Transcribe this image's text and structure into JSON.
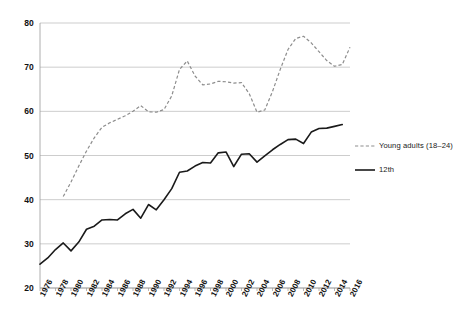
{
  "chart_data": {
    "type": "line",
    "title": "",
    "xlabel": "",
    "ylabel": "",
    "xlim": [
      1976,
      2016
    ],
    "ylim": [
      20,
      80
    ],
    "yticks": [
      20,
      30,
      40,
      50,
      60,
      70,
      80
    ],
    "xticks": [
      1976,
      1978,
      1980,
      1982,
      1984,
      1986,
      1988,
      1990,
      1992,
      1994,
      1996,
      1998,
      2000,
      2002,
      2004,
      2006,
      2008,
      2010,
      2012,
      2014,
      2016
    ],
    "grid": "horizontal",
    "legend_position": "right",
    "series": [
      {
        "name": "Young adults (18–24)",
        "style": "dashed",
        "color": "#8d8d8d",
        "x": [
          1979,
          1980,
          1981,
          1982,
          1983,
          1984,
          1985,
          1986,
          1987,
          1988,
          1989,
          1990,
          1991,
          1992,
          1993,
          1994,
          1995,
          1996,
          1997,
          1998,
          1999,
          2000,
          2001,
          2002,
          2003,
          2004,
          2005,
          2006,
          2007,
          2008,
          2009,
          2010,
          2011,
          2012,
          2013,
          2014,
          2015,
          2016
        ],
        "values": [
          40.7,
          44.0,
          47.6,
          51.0,
          54.0,
          56.4,
          57.4,
          58.2,
          59.0,
          60.0,
          61.3,
          59.9,
          59.8,
          60.4,
          63.5,
          69.5,
          71.4,
          68.0,
          66.0,
          66.2,
          66.8,
          66.7,
          66.4,
          66.5,
          64.0,
          59.8,
          60.3,
          64.5,
          69.5,
          74.0,
          76.5,
          77.0,
          75.5,
          73.5,
          71.5,
          70.2,
          70.6,
          74.5
        ]
      },
      {
        "name": "12th",
        "style": "solid",
        "color": "#1a1a1a",
        "x": [
          1976,
          1977,
          1978,
          1979,
          1980,
          1981,
          1982,
          1983,
          1984,
          1985,
          1986,
          1987,
          1988,
          1989,
          1990,
          1991,
          1992,
          1993,
          1994,
          1995,
          1996,
          1997,
          1998,
          1999,
          2000,
          2001,
          2002,
          2003,
          2004,
          2005,
          2006,
          2007,
          2008,
          2009,
          2010,
          2011,
          2012,
          2013,
          2014,
          2015
        ],
        "values": [
          25.4,
          26.8,
          28.7,
          30.2,
          28.4,
          30.4,
          33.3,
          34.0,
          35.4,
          35.5,
          35.4,
          36.8,
          37.8,
          35.8,
          38.9,
          37.7,
          40.0,
          42.5,
          46.2,
          46.5,
          47.6,
          48.4,
          48.3,
          50.6,
          50.8,
          47.5,
          50.3,
          50.4,
          48.5,
          49.9,
          51.3,
          52.5,
          53.6,
          53.7,
          52.7,
          55.3,
          56.1,
          56.2,
          56.6,
          57.0
        ]
      }
    ]
  },
  "axes": {
    "y_tick_labels": [
      "20",
      "30",
      "40",
      "50",
      "60",
      "70",
      "80"
    ],
    "x_tick_labels": [
      "1976",
      "1978",
      "1980",
      "1982",
      "1984",
      "1986",
      "1988",
      "1990",
      "1992",
      "1994",
      "1996",
      "1998",
      "2000",
      "2002",
      "2004",
      "2006",
      "2008",
      "2010",
      "2012",
      "2014",
      "2016"
    ]
  },
  "legend": {
    "items": [
      {
        "label": "Young adults (18–24)",
        "style": "dashed",
        "color": "#8d8d8d"
      },
      {
        "label": "12th",
        "style": "solid",
        "color": "#1a1a1a"
      }
    ]
  },
  "colors": {
    "background": "#ffffff",
    "gridline": "#b8b8b8",
    "axis": "#9a9a9a",
    "series_young_adults": "#8d8d8d",
    "series_12th": "#1a1a1a",
    "text": "#111111"
  }
}
